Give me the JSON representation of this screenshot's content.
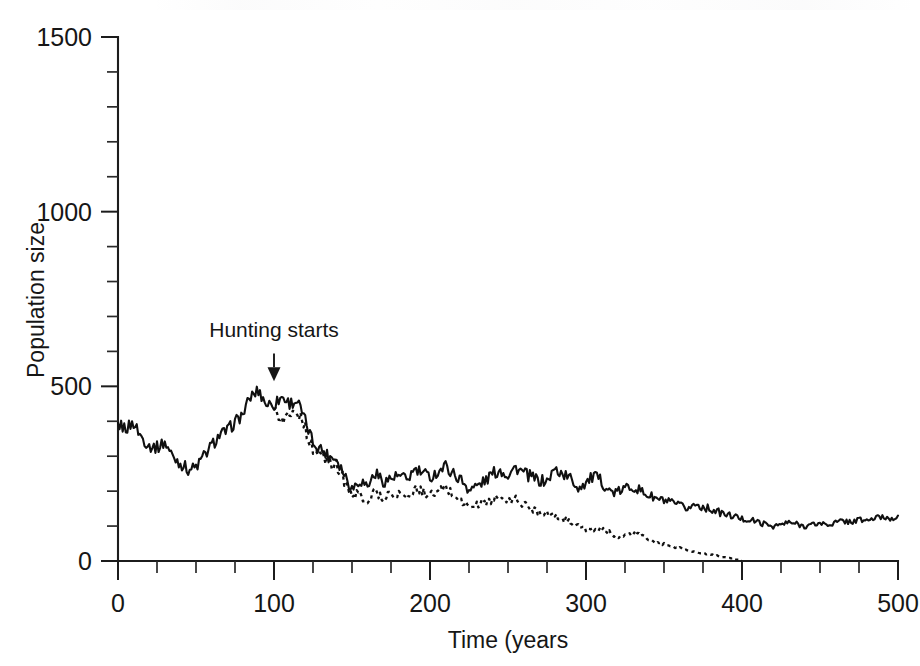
{
  "figure": {
    "page_header_text": "",
    "background_color": "#ffffff",
    "ink_color": "#101010"
  },
  "chart_data": {
    "type": "line",
    "title": "",
    "xlabel": "Time (years",
    "ylabel": "Population size",
    "xlim": [
      0,
      500
    ],
    "ylim": [
      0,
      1500
    ],
    "grid": false,
    "legend": "none",
    "x_ticks_major": [
      0,
      100,
      200,
      300,
      400,
      500
    ],
    "x_tick_labels": [
      "0",
      "100",
      "200",
      "300",
      "400",
      "500"
    ],
    "x_tick_minor_step": 25,
    "y_ticks_major": [
      0,
      500,
      1000,
      1500
    ],
    "y_tick_labels": [
      "0",
      "500",
      "1000",
      "1500"
    ],
    "y_tick_minor_step": 100,
    "annotations": [
      {
        "text": "Hunting starts",
        "x": 100,
        "y": 640,
        "arrow_to_x": 100,
        "arrow_to_y": 520,
        "style": "down-arrow"
      }
    ],
    "series": [
      {
        "name": "No hunting (solid)",
        "style": "solid",
        "x": [
          0,
          5,
          10,
          15,
          20,
          25,
          30,
          35,
          40,
          45,
          50,
          55,
          60,
          65,
          70,
          75,
          80,
          85,
          90,
          95,
          100,
          105,
          110,
          115,
          120,
          125,
          130,
          135,
          140,
          145,
          150,
          155,
          160,
          165,
          170,
          175,
          180,
          185,
          190,
          195,
          200,
          205,
          210,
          215,
          220,
          225,
          230,
          235,
          240,
          245,
          250,
          255,
          260,
          265,
          270,
          275,
          280,
          285,
          290,
          295,
          300,
          305,
          310,
          315,
          320,
          325,
          330,
          335,
          340,
          345,
          350,
          355,
          360,
          365,
          370,
          375,
          380,
          385,
          390,
          395,
          400,
          405,
          410,
          415,
          420,
          425,
          430,
          435,
          440,
          445,
          450,
          455,
          460,
          465,
          470,
          475,
          480,
          485,
          490,
          495,
          500
        ],
        "values": [
          390,
          380,
          395,
          355,
          330,
          325,
          340,
          300,
          280,
          262,
          268,
          300,
          330,
          360,
          372,
          398,
          420,
          470,
          488,
          450,
          448,
          470,
          452,
          458,
          400,
          340,
          322,
          300,
          295,
          250,
          208,
          232,
          215,
          252,
          228,
          236,
          243,
          232,
          260,
          252,
          240,
          255,
          272,
          250,
          232,
          205,
          215,
          228,
          250,
          260,
          248,
          268,
          252,
          240,
          230,
          228,
          262,
          250,
          236,
          210,
          225,
          242,
          228,
          200,
          195,
          208,
          215,
          200,
          188,
          178,
          172,
          165,
          158,
          150,
          162,
          155,
          148,
          140,
          132,
          128,
          120,
          118,
          112,
          105,
          100,
          104,
          110,
          106,
          100,
          104,
          108,
          104,
          110,
          115,
          112,
          118,
          116,
          122,
          126,
          122,
          130
        ]
      },
      {
        "name": "With hunting (dotted)",
        "style": "dotted",
        "x": [
          100,
          105,
          110,
          115,
          120,
          125,
          130,
          135,
          140,
          145,
          150,
          155,
          160,
          165,
          170,
          175,
          180,
          185,
          190,
          195,
          200,
          205,
          210,
          215,
          220,
          225,
          230,
          235,
          240,
          245,
          250,
          255,
          260,
          265,
          270,
          275,
          280,
          285,
          290,
          295,
          300,
          305,
          310,
          315,
          320,
          325,
          330,
          335,
          340,
          345,
          350,
          355,
          360,
          365,
          370,
          375,
          380,
          385,
          390,
          395,
          400
        ],
        "values": [
          448,
          400,
          420,
          430,
          380,
          318,
          300,
          282,
          272,
          232,
          185,
          192,
          172,
          200,
          180,
          192,
          196,
          180,
          205,
          198,
          188,
          196,
          210,
          190,
          172,
          155,
          160,
          168,
          175,
          180,
          170,
          178,
          162,
          150,
          142,
          138,
          128,
          120,
          112,
          100,
          92,
          86,
          90,
          82,
          70,
          72,
          78,
          74,
          62,
          52,
          48,
          40,
          38,
          30,
          26,
          22,
          18,
          14,
          10,
          5,
          0
        ]
      }
    ]
  }
}
